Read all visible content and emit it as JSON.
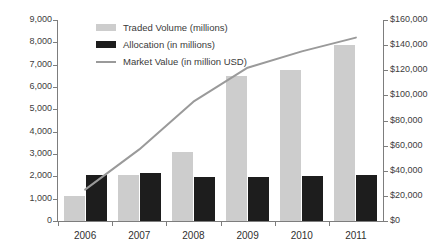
{
  "chart_data": {
    "type": "bar",
    "title": "",
    "subtitle": "",
    "xlabel": "",
    "ylabel": "",
    "categories": [
      "2006",
      "2007",
      "2008",
      "2009",
      "2010",
      "2011"
    ],
    "series": [
      {
        "name": "Traded Volume (millions)",
        "type": "bar",
        "axis": "left",
        "color": "#cdcdcd",
        "values": [
          1100,
          2050,
          3100,
          6500,
          6750,
          7900
        ]
      },
      {
        "name": "Allocation (in millions)",
        "type": "bar",
        "axis": "left",
        "color": "#1d1d1d",
        "values": [
          2080,
          2170,
          1980,
          1990,
          2000,
          2050
        ]
      },
      {
        "name": "Market Value (in million USD)",
        "type": "line",
        "axis": "right",
        "color": "#9a9a9a",
        "values": [
          25000,
          57000,
          95000,
          122000,
          135000,
          146000
        ]
      }
    ],
    "left_axis": {
      "label": "",
      "min": 0,
      "max": 9000,
      "step": 1000,
      "ticks": [
        "0",
        "1,000",
        "2,000",
        "3,000",
        "4,000",
        "5,000",
        "6,000",
        "7,000",
        "8,000",
        "9,000"
      ]
    },
    "right_axis": {
      "label": "",
      "min": 0,
      "max": 160000,
      "step": 20000,
      "ticks": [
        "$0",
        "$20,000",
        "$40,000",
        "$60,000",
        "$80,000",
        "$100,000",
        "$120,000",
        "$140,000",
        "$160,000"
      ]
    },
    "grid": false,
    "legend_position": "top-left"
  },
  "legend": {
    "items": [
      {
        "label": "Traded Volume (millions)",
        "color": "#cdcdcd",
        "marker": "box"
      },
      {
        "label": "Allocation (in millions)",
        "color": "#1d1d1d",
        "marker": "box"
      },
      {
        "label": "Market Value (in million USD)",
        "color": "#9a9a9a",
        "marker": "line"
      }
    ]
  }
}
